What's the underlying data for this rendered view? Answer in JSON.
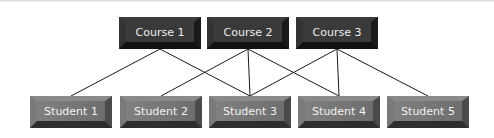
{
  "diagram": {
    "courses": [
      {
        "id": "c1",
        "label": "Course 1",
        "x": 119,
        "y": 17
      },
      {
        "id": "c2",
        "label": "Course 2",
        "x": 207,
        "y": 17
      },
      {
        "id": "c3",
        "label": "Course 3",
        "x": 296,
        "y": 17
      }
    ],
    "students": [
      {
        "id": "s1",
        "label": "Student 1",
        "x": 30,
        "y": 96
      },
      {
        "id": "s2",
        "label": "Student 2",
        "x": 120,
        "y": 96
      },
      {
        "id": "s3",
        "label": "Student 3",
        "x": 209,
        "y": 96
      },
      {
        "id": "s4",
        "label": "Student 4",
        "x": 298,
        "y": 96
      },
      {
        "id": "s5",
        "label": "Student 5",
        "x": 387,
        "y": 96
      }
    ],
    "edges": [
      [
        "c1",
        "s1"
      ],
      [
        "c1",
        "s3"
      ],
      [
        "c2",
        "s2"
      ],
      [
        "c2",
        "s3"
      ],
      [
        "c2",
        "s4"
      ],
      [
        "c3",
        "s3"
      ],
      [
        "c3",
        "s4"
      ],
      [
        "c3",
        "s5"
      ]
    ],
    "colors": {
      "course_fill": "#2a2a2a",
      "student_fill": "#6e6e6e",
      "line": "#1a1a1a"
    }
  }
}
